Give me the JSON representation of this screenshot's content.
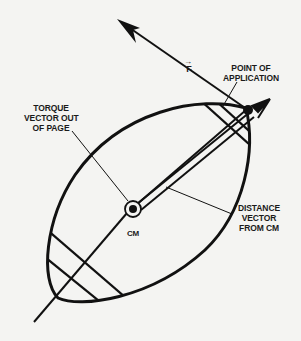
{
  "figure": {
    "type": "physics-diagram",
    "labels": {
      "torque": [
        "TORQUE",
        "VECTOR OUT",
        "OF PAGE"
      ],
      "point_of_application": [
        "POINT OF",
        "APPLICATION"
      ],
      "force": "F",
      "force_vector_mark": "→",
      "center_of_mass": "CM",
      "distance": [
        "DISTANCE",
        "VECTOR",
        "FROM CM"
      ]
    },
    "colors": {
      "ink": "#111111",
      "background": "#f4f4f2"
    },
    "elements": [
      {
        "name": "football-body",
        "shape": "tilted ellipse"
      },
      {
        "name": "force-arrow",
        "from": "point of application",
        "direction": "up-left"
      },
      {
        "name": "distance-vector",
        "from": "CM",
        "to": "point of application"
      },
      {
        "name": "long-axis-line",
        "through": "CM"
      },
      {
        "name": "cm-marker",
        "shape": "circle with dot"
      }
    ]
  }
}
